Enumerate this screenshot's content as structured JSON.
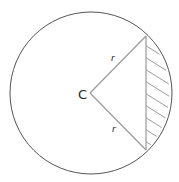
{
  "diagram": {
    "center_label": "C",
    "radius_label_top": "r",
    "radius_label_bottom": "r",
    "colors": {
      "circle": "#555555",
      "radius_lines": "#9a9a9a",
      "hatch": "#9a9a9a",
      "label": "#222222"
    }
  }
}
